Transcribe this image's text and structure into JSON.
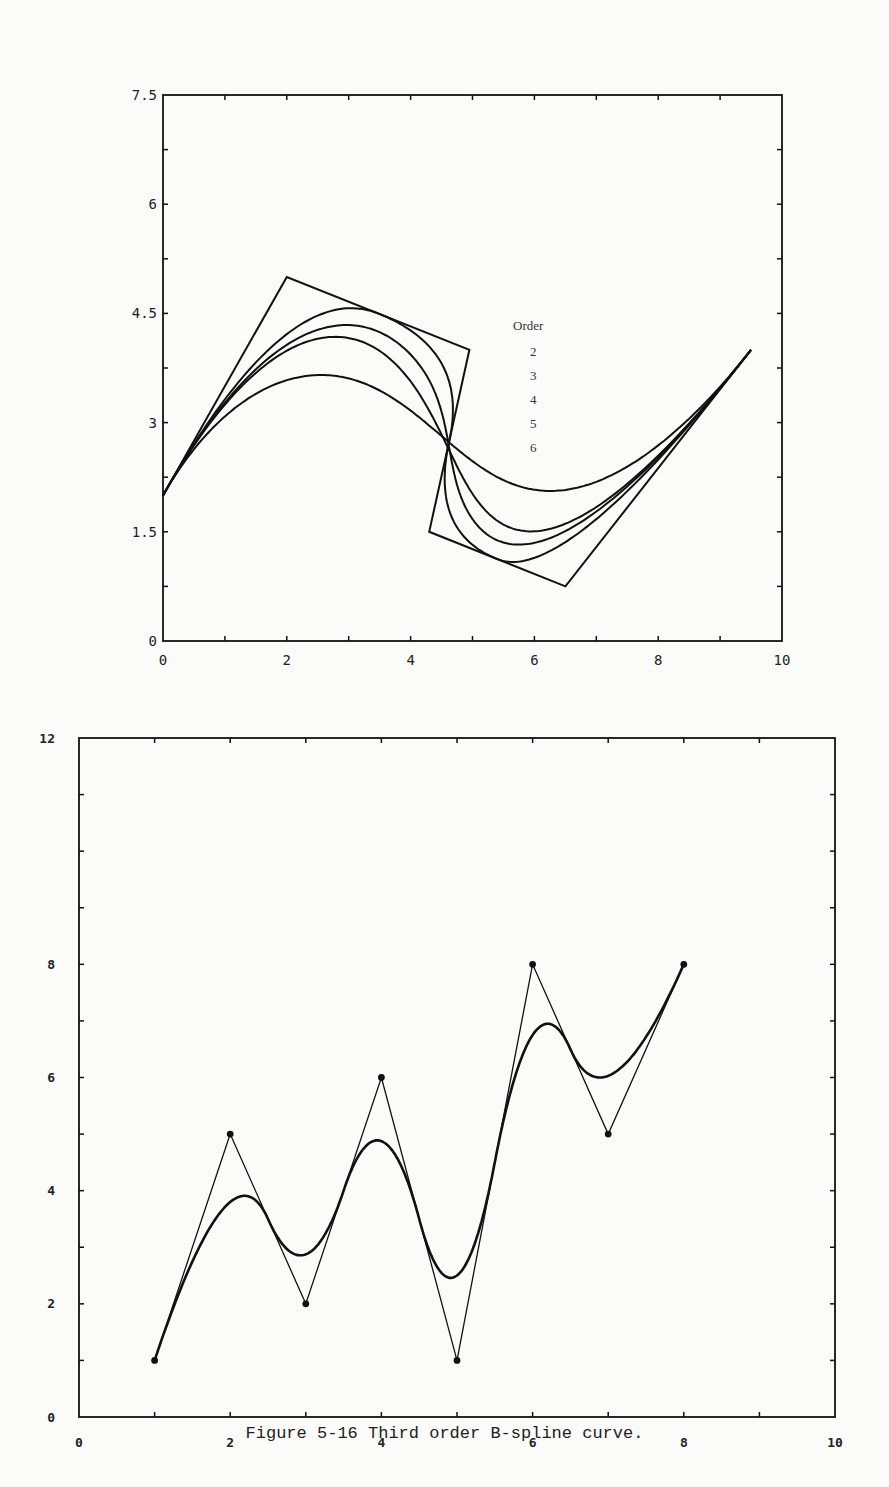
{
  "caption": "Figure 5-16  Third order B-spline curve.",
  "legend": {
    "title": "Order",
    "items": [
      "2",
      "3",
      "4",
      "5",
      "6"
    ]
  },
  "chart_data": [
    {
      "type": "line",
      "title": "",
      "xlabel": "",
      "ylabel": "",
      "xlim": [
        0,
        10
      ],
      "ylim": [
        0,
        7.5
      ],
      "x_ticks": [
        "0",
        "2",
        "4",
        "6",
        "8",
        "10"
      ],
      "y_ticks": [
        "0",
        "1.5",
        "3",
        "4.5",
        "6",
        "7.5"
      ],
      "grid": false,
      "legend_position": "inside center-right",
      "control_polygon": [
        [
          0,
          2
        ],
        [
          2,
          5
        ],
        [
          4.95,
          4
        ],
        [
          4.3,
          1.5
        ],
        [
          6.5,
          0.75
        ],
        [
          9.5,
          4
        ]
      ],
      "series": [
        {
          "name": "Order 2",
          "order": 2
        },
        {
          "name": "Order 3",
          "order": 3
        },
        {
          "name": "Order 4",
          "order": 4
        },
        {
          "name": "Order 5",
          "order": 5
        },
        {
          "name": "Order 6",
          "order": 6
        }
      ]
    },
    {
      "type": "line",
      "title": "Third order B-spline curve",
      "xlabel": "",
      "ylabel": "",
      "xlim": [
        0,
        10
      ],
      "ylim": [
        0,
        12
      ],
      "x_ticks": [
        "0",
        "2",
        "4",
        "6",
        "8",
        "10"
      ],
      "y_ticks": [
        "0",
        "2",
        "4",
        "6",
        "8",
        "12"
      ],
      "grid": false,
      "control_points": [
        [
          1,
          1
        ],
        [
          2,
          5
        ],
        [
          3,
          2
        ],
        [
          4,
          6
        ],
        [
          5,
          1
        ],
        [
          6,
          8
        ],
        [
          7,
          5
        ],
        [
          8,
          8
        ]
      ],
      "series": [
        {
          "name": "Control polygon",
          "order": 2
        },
        {
          "name": "B-spline curve",
          "order": 3
        }
      ]
    }
  ],
  "colors": {
    "ink": "#111111",
    "paper": "#fbfbfa"
  }
}
